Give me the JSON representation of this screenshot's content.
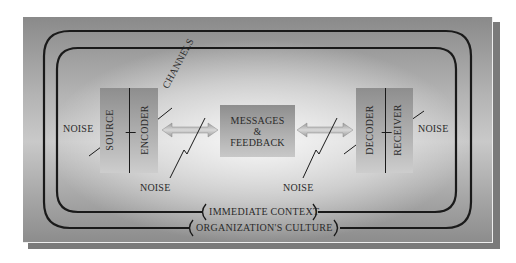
{
  "diagram": {
    "colors": {
      "panel_dark": "#8a8a8a",
      "panel_light": "#e6e6e6",
      "line": "#1a1a1a",
      "text": "#2a2a2a",
      "shadow": "#7a7a7a"
    },
    "sender_box": {
      "left_label": "SOURCE",
      "right_label": "ENCODER"
    },
    "channels_label": "CHANNELS",
    "message_box": {
      "line1": "MESSAGES",
      "line2": "&",
      "line3": "FEEDBACK"
    },
    "receiver_box": {
      "left_label": "DECODER",
      "right_label": "RECEIVER"
    },
    "noise_labels": {
      "left": "NOISE",
      "channel_left": "NOISE",
      "channel_right": "NOISE",
      "right": "NOISE"
    },
    "context_labels": {
      "inner": "IMMEDIATE CONTEXT",
      "outer": "ORGANIZATION'S CULTURE"
    }
  }
}
